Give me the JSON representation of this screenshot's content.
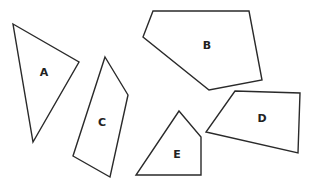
{
  "diagram": {
    "title": "",
    "stroke_color": "#2a2a2a",
    "fill_color": "#ffffff",
    "shapes": [
      {
        "label": "A",
        "type": "triangle",
        "points": [
          [
            13,
            24
          ],
          [
            79,
            62
          ],
          [
            33,
            142
          ]
        ],
        "label_pos": [
          44,
          72
        ]
      },
      {
        "label": "B",
        "type": "pentagon",
        "points": [
          [
            153,
            11
          ],
          [
            249,
            11
          ],
          [
            262,
            80
          ],
          [
            209,
            90
          ],
          [
            143,
            37
          ]
        ],
        "label_pos": [
          207,
          45
        ]
      },
      {
        "label": "C",
        "type": "quadrilateral",
        "points": [
          [
            105,
            57
          ],
          [
            128,
            95
          ],
          [
            110,
            177
          ],
          [
            73,
            156
          ]
        ],
        "label_pos": [
          102,
          122
        ]
      },
      {
        "label": "D",
        "type": "quadrilateral",
        "points": [
          [
            235,
            91
          ],
          [
            300,
            93
          ],
          [
            298,
            153
          ],
          [
            206,
            132
          ]
        ],
        "label_pos": [
          262,
          118
        ]
      },
      {
        "label": "E",
        "type": "pentagon",
        "points": [
          [
            179,
            111
          ],
          [
            201,
            137
          ],
          [
            201,
            175
          ],
          [
            136,
            175
          ]
        ],
        "label_pos": [
          177,
          154
        ]
      }
    ]
  }
}
